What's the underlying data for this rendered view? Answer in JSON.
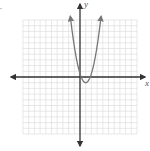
{
  "problem_label": ".",
  "chart_data": {
    "type": "line",
    "title": "",
    "xlabel": "x",
    "ylabel": "y",
    "xlim": [
      -10,
      10
    ],
    "ylim": [
      -10,
      10
    ],
    "grid": true,
    "legend": null,
    "series": [
      {
        "name": "parabola",
        "equation_shape": "upward-opening parabola, vertex slightly right of origin and slightly below x-axis",
        "vertex": [
          1,
          -1
        ],
        "y_intercept": [
          0,
          0.5
        ],
        "x": [
          -1.7,
          -1,
          -0.5,
          0,
          0.5,
          1,
          1.5,
          2,
          2.5,
          3,
          3.7
        ],
        "y": [
          13,
          7,
          3.2,
          0.6,
          -0.6,
          -1,
          -0.6,
          0.6,
          3.2,
          7,
          13
        ]
      }
    ]
  },
  "colors": {
    "grid": "#d9d9d9",
    "axis": "#333333",
    "curve": "#777777"
  }
}
